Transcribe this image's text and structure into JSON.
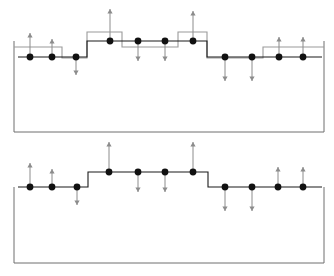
{
  "figure": {
    "title": "",
    "width": 334,
    "height": 276,
    "background": "#ffffff",
    "panel_count": 2
  },
  "style": {
    "dot_color": "#111111",
    "dot_radius": 3.4,
    "black_line_color": "#1a1a1a",
    "gray_line_color": "#9a9a9a",
    "box_line_color": "#6e6e6e",
    "arrow_color": "#8c8c8c",
    "black_line_width": 1.1,
    "gray_line_width": 1.1,
    "box_line_width": 1.0,
    "arrow_line_width": 1.0,
    "arrow_head_size": 2.6
  },
  "chart_data": {
    "type": "line",
    "xlabel": "",
    "ylabel": "",
    "panels": [
      {
        "name": "top-panel",
        "box": {
          "x": 14,
          "y": 41,
          "width": 310,
          "height": 91
        },
        "series": [
          {
            "name": "black-step-profile",
            "color": "#1a1a1a",
            "steps": [
              {
                "x0": 18,
                "x1": 87,
                "y": 57
              },
              {
                "x0": 87,
                "x1": 207,
                "y": 41
              },
              {
                "x0": 207,
                "x1": 265,
                "y": 57
              },
              {
                "x0": 265,
                "x1": 322,
                "y": 57
              }
            ]
          },
          {
            "name": "gray-step-profile",
            "color": "#9a9a9a",
            "steps": [
              {
                "x0": 14,
                "x1": 62,
                "y": 47
              },
              {
                "x0": 62,
                "x1": 87,
                "y": 58
              },
              {
                "x0": 87,
                "x1": 122,
                "y": 32
              },
              {
                "x0": 122,
                "x1": 178,
                "y": 47
              },
              {
                "x0": 178,
                "x1": 207,
                "y": 32
              },
              {
                "x0": 207,
                "x1": 263,
                "y": 58
              },
              {
                "x0": 263,
                "x1": 324,
                "y": 47
              }
            ]
          }
        ],
        "sites": [
          {
            "id": 1,
            "x": 30,
            "y": 57,
            "arrow": "up",
            "arrow_length": 24
          },
          {
            "id": 2,
            "x": 52,
            "y": 57,
            "arrow": "up",
            "arrow_length": 18
          },
          {
            "id": 3,
            "x": 76,
            "y": 57,
            "arrow": "down",
            "arrow_length": 18
          },
          {
            "id": 4,
            "x": 110,
            "y": 41,
            "arrow": "up",
            "arrow_length": 32
          },
          {
            "id": 5,
            "x": 138,
            "y": 41,
            "arrow": "down",
            "arrow_length": 20
          },
          {
            "id": 6,
            "x": 165,
            "y": 41,
            "arrow": "down",
            "arrow_length": 20
          },
          {
            "id": 7,
            "x": 193,
            "y": 41,
            "arrow": "up",
            "arrow_length": 30
          },
          {
            "id": 8,
            "x": 225,
            "y": 57,
            "arrow": "down",
            "arrow_length": 24
          },
          {
            "id": 9,
            "x": 252,
            "y": 57,
            "arrow": "down",
            "arrow_length": 24
          },
          {
            "id": 10,
            "x": 279,
            "y": 57,
            "arrow": "up",
            "arrow_length": 20
          },
          {
            "id": 11,
            "x": 303,
            "y": 57,
            "arrow": "up",
            "arrow_length": 20
          }
        ]
      },
      {
        "name": "bottom-panel",
        "box": {
          "x": 14,
          "y": 47,
          "width": 310,
          "height": 76
        },
        "series": [
          {
            "name": "black-step-profile",
            "color": "#1a1a1a",
            "steps": [
              {
                "x0": 18,
                "x1": 88,
                "y": 47
              },
              {
                "x0": 88,
                "x1": 208,
                "y": 32
              },
              {
                "x0": 208,
                "x1": 322,
                "y": 47
              }
            ]
          }
        ],
        "sites": [
          {
            "id": 1,
            "x": 30,
            "y": 47,
            "arrow": "up",
            "arrow_length": 24
          },
          {
            "id": 2,
            "x": 52,
            "y": 47,
            "arrow": "up",
            "arrow_length": 18
          },
          {
            "id": 3,
            "x": 77,
            "y": 47,
            "arrow": "down",
            "arrow_length": 18
          },
          {
            "id": 4,
            "x": 109,
            "y": 32,
            "arrow": "up",
            "arrow_length": 30
          },
          {
            "id": 5,
            "x": 138,
            "y": 32,
            "arrow": "down",
            "arrow_length": 20
          },
          {
            "id": 6,
            "x": 165,
            "y": 32,
            "arrow": "down",
            "arrow_length": 20
          },
          {
            "id": 7,
            "x": 193,
            "y": 32,
            "arrow": "up",
            "arrow_length": 30
          },
          {
            "id": 8,
            "x": 225,
            "y": 47,
            "arrow": "down",
            "arrow_length": 24
          },
          {
            "id": 9,
            "x": 252,
            "y": 47,
            "arrow": "down",
            "arrow_length": 24
          },
          {
            "id": 10,
            "x": 278,
            "y": 47,
            "arrow": "up",
            "arrow_length": 20
          },
          {
            "id": 11,
            "x": 303,
            "y": 47,
            "arrow": "up",
            "arrow_length": 20
          }
        ]
      }
    ]
  }
}
